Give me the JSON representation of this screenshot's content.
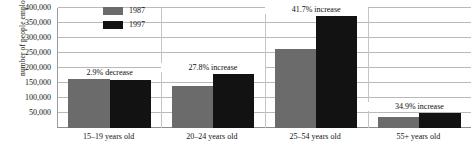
{
  "chart_data": {
    "type": "bar",
    "title": "",
    "xlabel": "",
    "ylabel": "number of people employed",
    "ylim": [
      0,
      400000
    ],
    "grid": true,
    "legend_position": "top-left-inside",
    "categories": [
      "15–19 years old",
      "20–24 years old",
      "25–54 years old",
      "55+ years old"
    ],
    "y_ticks": [
      "400,000",
      "350,000",
      "300,000",
      "250,000",
      "200,000",
      "150,000",
      "100,000",
      "50,000"
    ],
    "y_tick_values": [
      400000,
      350000,
      300000,
      250000,
      200000,
      150000,
      100000,
      50000
    ],
    "series": [
      {
        "name": "1987",
        "color": "#6b6b6b",
        "values": [
          165000,
          141000,
          265000,
          38000
        ]
      },
      {
        "name": "1997",
        "color": "#121212",
        "values": [
          160000,
          180000,
          375000,
          51000
        ]
      }
    ],
    "annotations": [
      "2.9% decrease",
      "27.8% increase",
      "41.7% increase",
      "34.9% increase"
    ]
  },
  "legend": {
    "items": [
      {
        "label": "1987",
        "color": "#6b6b6b"
      },
      {
        "label": "1997",
        "color": "#121212"
      }
    ]
  }
}
